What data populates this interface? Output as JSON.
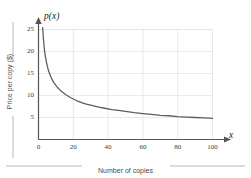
{
  "chart_data": {
    "type": "line",
    "title": "",
    "subtitle": "",
    "xlabel": "x",
    "ylabel": "p(x)",
    "x_caption": "Number of copies",
    "y_caption": "Price per copy ($)",
    "xlim": [
      0,
      104
    ],
    "ylim": [
      0,
      27
    ],
    "xticks": [
      0,
      20,
      40,
      60,
      80,
      100
    ],
    "yticks": [
      5,
      10,
      15,
      20,
      25
    ],
    "xtick_labels": [
      "0",
      "20",
      "40",
      "60",
      "80",
      "100"
    ],
    "ytick_labels": [
      "5",
      "10",
      "15",
      "20",
      "25"
    ],
    "grid": true,
    "grid_color": "#e3e3e8",
    "legend": "none",
    "axis_color": "#555558",
    "curve_color": "#5d5d62",
    "series": [
      {
        "name": "p(x)",
        "x": [
          2.4,
          2.8,
          3.2,
          3.6,
          4,
          4.5,
          5,
          5.5,
          6,
          7,
          8,
          9,
          10,
          11,
          12,
          13,
          14,
          15,
          16,
          18,
          20,
          22,
          24,
          26,
          28,
          30,
          34,
          38,
          42,
          46,
          50,
          55,
          60,
          65,
          70,
          75,
          80,
          85,
          90,
          95,
          100
        ],
        "y": [
          25.4,
          23.0,
          21.2,
          19.8,
          18.8,
          17.7,
          16.8,
          16.0,
          15.4,
          14.3,
          13.5,
          12.8,
          12.3,
          11.8,
          11.4,
          11.0,
          10.7,
          10.4,
          10.1,
          9.6,
          9.2,
          8.8,
          8.5,
          8.2,
          8.0,
          7.8,
          7.4,
          7.1,
          6.8,
          6.6,
          6.4,
          6.1,
          5.9,
          5.7,
          5.5,
          5.4,
          5.2,
          5.1,
          5.0,
          4.9,
          4.8
        ],
        "color": "#5d5d62"
      }
    ]
  },
  "axis_labels": {
    "y_axis_name": "p(x)",
    "x_axis_name": "x"
  },
  "captions": {
    "x_caption": "Number of copies",
    "y_caption": "Price per copy ($)"
  }
}
